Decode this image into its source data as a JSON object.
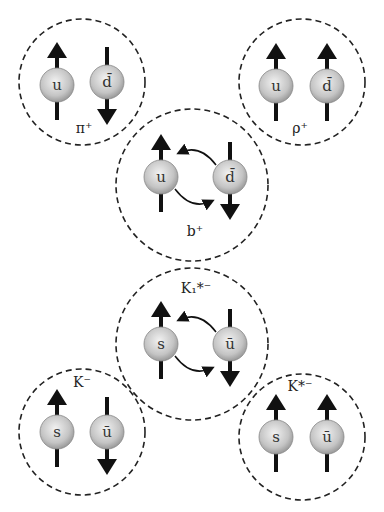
{
  "colors": {
    "ball": "#c8c8c8",
    "line": "#111111",
    "dash": "#222222"
  },
  "mesons": [
    {
      "id": "pi",
      "label": "π⁺",
      "cx": 82,
      "cy": 82,
      "r": 63,
      "quarks": [
        {
          "name": "u",
          "spin": "up",
          "x": 57,
          "y": 85
        },
        {
          "name": "d̄",
          "spin": "down",
          "x": 107,
          "y": 82
        }
      ],
      "exchange": false,
      "lx": 84,
      "ly": 133
    },
    {
      "id": "rho",
      "label": "ρ⁺",
      "cx": 302,
      "cy": 82,
      "r": 63,
      "quarks": [
        {
          "name": "u",
          "spin": "up",
          "x": 276,
          "y": 86
        },
        {
          "name": "d̄",
          "spin": "up",
          "x": 327,
          "y": 86
        }
      ],
      "exchange": false,
      "lx": 300,
      "ly": 133
    },
    {
      "id": "b",
      "label": "b⁺",
      "cx": 192,
      "cy": 185,
      "r": 76,
      "quarks": [
        {
          "name": "u",
          "spin": "up",
          "x": 161,
          "y": 177
        },
        {
          "name": "d̄",
          "spin": "down",
          "x": 230,
          "y": 177
        }
      ],
      "exchange": true,
      "lx": 195,
      "ly": 236
    },
    {
      "id": "k1",
      "label": "K₁*⁻",
      "cx": 192,
      "cy": 344,
      "r": 76,
      "quarks": [
        {
          "name": "s",
          "spin": "up",
          "x": 161,
          "y": 344
        },
        {
          "name": "ū",
          "spin": "down",
          "x": 230,
          "y": 344
        }
      ],
      "exchange": true,
      "lx": 196,
      "ly": 293
    },
    {
      "id": "k",
      "label": "K⁻",
      "cx": 82,
      "cy": 432,
      "r": 63,
      "quarks": [
        {
          "name": "s",
          "spin": "up",
          "x": 57,
          "y": 432
        },
        {
          "name": "ū",
          "spin": "down",
          "x": 107,
          "y": 432
        }
      ],
      "exchange": false,
      "lx": 82,
      "ly": 387
    },
    {
      "id": "kstar",
      "label": "K*⁻",
      "cx": 302,
      "cy": 437,
      "r": 63,
      "quarks": [
        {
          "name": "s",
          "spin": "up",
          "x": 276,
          "y": 437
        },
        {
          "name": "ū",
          "spin": "up",
          "x": 327,
          "y": 437
        }
      ],
      "exchange": false,
      "lx": 300,
      "ly": 391
    }
  ]
}
